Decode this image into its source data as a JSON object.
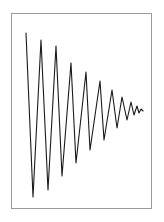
{
  "figure": {
    "title": "",
    "background_color": "#ffffff",
    "frame_color": "#9a9a9a",
    "line_color": "#1a1a1a",
    "line_width": 1.1
  },
  "chart_data": {
    "type": "line",
    "title": "",
    "subtitle": "",
    "xlabel": "",
    "ylabel": "",
    "grid": false,
    "legend": false,
    "legend_position": "none",
    "axis_ticks": false,
    "tick_labels": [],
    "annotations": [],
    "xlim": [
      0,
      11
    ],
    "ylim": [
      -1.05,
      1.05
    ],
    "series": [
      {
        "name": "damped-oscillation",
        "color": "#1a1a1a",
        "x": [
          0.0,
          0.25,
          0.5,
          0.75,
          1.0,
          1.25,
          1.5,
          1.75,
          2.0,
          2.25,
          2.5,
          2.75,
          3.0,
          3.25,
          3.5,
          3.75,
          4.0,
          4.25,
          4.5,
          4.75,
          5.0,
          5.25,
          5.5,
          5.75,
          6.0,
          6.25,
          6.5,
          6.75,
          7.0,
          7.25,
          7.5,
          7.75,
          8.0,
          8.25,
          8.5,
          8.75,
          9.0,
          9.25,
          9.5,
          9.75,
          10.0,
          10.25,
          10.5,
          10.75,
          11.0
        ],
        "y": [
          1.0,
          0.21,
          -0.78,
          -0.96,
          -0.09,
          0.8,
          0.86,
          0.02,
          -0.72,
          -0.78,
          -0.01,
          0.63,
          0.68,
          0.02,
          -0.56,
          -0.6,
          -0.01,
          0.49,
          0.52,
          0.01,
          -0.42,
          -0.45,
          -0.01,
          0.36,
          0.38,
          0.01,
          -0.3,
          -0.32,
          0.0,
          0.25,
          0.26,
          0.0,
          -0.2,
          -0.21,
          0.0,
          0.16,
          0.17,
          0.0,
          -0.12,
          -0.12,
          0.0,
          0.08,
          0.05,
          0.02,
          0.0
        ]
      }
    ],
    "peaks": [
      {
        "index": 1,
        "x_px": 26,
        "y_px": 33,
        "amplitude": 1.0
      },
      {
        "index": 2,
        "x_px": 41,
        "y_px": 40,
        "amplitude": 0.86
      },
      {
        "index": 3,
        "x_px": 56,
        "y_px": 46,
        "amplitude": 0.73
      },
      {
        "index": 4,
        "x_px": 71,
        "y_px": 63,
        "amplitude": 0.58
      },
      {
        "index": 5,
        "x_px": 86,
        "y_px": 72,
        "amplitude": 0.48
      },
      {
        "index": 6,
        "x_px": 100,
        "y_px": 81,
        "amplitude": 0.38
      },
      {
        "index": 7,
        "x_px": 112,
        "y_px": 90,
        "amplitude": 0.28
      },
      {
        "index": 8,
        "x_px": 122,
        "y_px": 97,
        "amplitude": 0.2
      },
      {
        "index": 9,
        "x_px": 131,
        "y_px": 102,
        "amplitude": 0.13
      },
      {
        "index": 10,
        "x_px": 137,
        "y_px": 106,
        "amplitude": 0.07
      }
    ],
    "troughs": [
      {
        "index": 1,
        "x_px": 33,
        "y_px": 197,
        "amplitude": -0.96
      },
      {
        "index": 2,
        "x_px": 48,
        "y_px": 190,
        "amplitude": -0.82
      },
      {
        "index": 3,
        "x_px": 62,
        "y_px": 176,
        "amplitude": -0.67
      },
      {
        "index": 4,
        "x_px": 76,
        "y_px": 163,
        "amplitude": -0.55
      },
      {
        "index": 5,
        "x_px": 90,
        "y_px": 150,
        "amplitude": -0.44
      },
      {
        "index": 6,
        "x_px": 104,
        "y_px": 140,
        "amplitude": -0.33
      },
      {
        "index": 7,
        "x_px": 117,
        "y_px": 128,
        "amplitude": -0.23
      },
      {
        "index": 8,
        "x_px": 127,
        "y_px": 120,
        "amplitude": -0.16
      },
      {
        "index": 9,
        "x_px": 134,
        "y_px": 115,
        "amplitude": -0.1
      }
    ],
    "baseline_px": 111,
    "tail_end_px": 143
  },
  "plot_path": "M 26 33 L 33 197 L 41 40 L 48 190 L 56 46 L 62 176 L 71 63 L 76 163 L 86 72 L 90 150 L 100 81 L 104 140 L 112 90 L 117 128 L 122 97 L 127 120 L 131 102 L 134 115 L 137 106 L 139 113 L 141 109 L 143 111"
}
